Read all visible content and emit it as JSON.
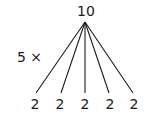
{
  "diagram": {
    "root": {
      "label": "10"
    },
    "multiplier": {
      "label": "5 ×"
    },
    "children": [
      {
        "label": "2"
      },
      {
        "label": "2"
      },
      {
        "label": "2"
      },
      {
        "label": "2"
      },
      {
        "label": "2"
      }
    ],
    "colors": {
      "line": "#1a1a1a",
      "text": "#1a1a1a",
      "background": "#ffffff"
    }
  }
}
